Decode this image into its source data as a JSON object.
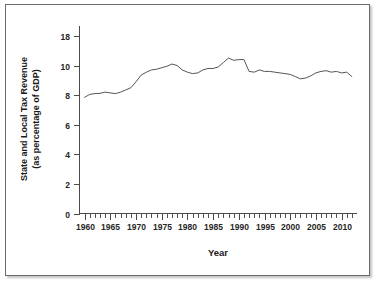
{
  "figure": {
    "border_color": "#6b6b6b",
    "background": "#ffffff"
  },
  "chart_data": {
    "type": "line",
    "title": "",
    "xlabel": "Year",
    "ylabel": "State and Local Tax Revenue (as percentage of GDP)",
    "ylabel_line1": "State and Local Tax Revenue",
    "ylabel_line2": "(as percentage of GDP)",
    "line_color": "#555555",
    "grid": false,
    "legend": false,
    "xlim": [
      1959,
      2013
    ],
    "ylim": [
      0,
      18
    ],
    "xticks": [
      1960,
      1965,
      1970,
      1975,
      1980,
      1985,
      1990,
      1995,
      2000,
      2005,
      2010
    ],
    "xtick_labels": [
      "1960",
      "1965",
      "1970",
      "1975",
      "1980",
      "1985",
      "1990",
      "1995",
      "2000",
      "2005",
      "2010"
    ],
    "x_minor_tick_step": 1,
    "yticks": [
      0,
      2,
      4,
      6,
      8,
      10,
      18
    ],
    "ytick_labels": [
      "0",
      "2",
      "4",
      "6",
      "8",
      "10",
      "18"
    ],
    "ytick_note": "axis spacing is uniform for 0-10; the 18 label sits one step above 10",
    "series": [
      {
        "name": "State and Local Tax Revenue (% of GDP)",
        "x": [
          1960,
          1961,
          1962,
          1963,
          1964,
          1965,
          1966,
          1967,
          1968,
          1969,
          1970,
          1971,
          1972,
          1973,
          1974,
          1975,
          1976,
          1977,
          1978,
          1979,
          1980,
          1981,
          1982,
          1983,
          1984,
          1985,
          1986,
          1987,
          1988,
          1989,
          1990,
          1991,
          1992,
          1993,
          1994,
          1995,
          1996,
          1997,
          1998,
          1999,
          2000,
          2001,
          2002,
          2003,
          2004,
          2005,
          2006,
          2007,
          2008,
          2009,
          2010,
          2011,
          2012
        ],
        "values": [
          7.85,
          8.05,
          8.1,
          8.12,
          8.2,
          8.15,
          8.1,
          8.2,
          8.35,
          8.5,
          8.9,
          9.35,
          9.55,
          9.7,
          9.75,
          9.85,
          9.95,
          10.1,
          10.0,
          9.7,
          9.55,
          9.45,
          9.5,
          9.7,
          9.8,
          9.8,
          9.9,
          10.2,
          10.5,
          10.35,
          10.4,
          10.4,
          9.6,
          9.55,
          9.7,
          9.6,
          9.6,
          9.55,
          9.5,
          9.45,
          9.4,
          9.25,
          9.1,
          9.15,
          9.3,
          9.5,
          9.6,
          9.65,
          9.55,
          9.6,
          9.5,
          9.55,
          9.25
        ]
      }
    ]
  }
}
